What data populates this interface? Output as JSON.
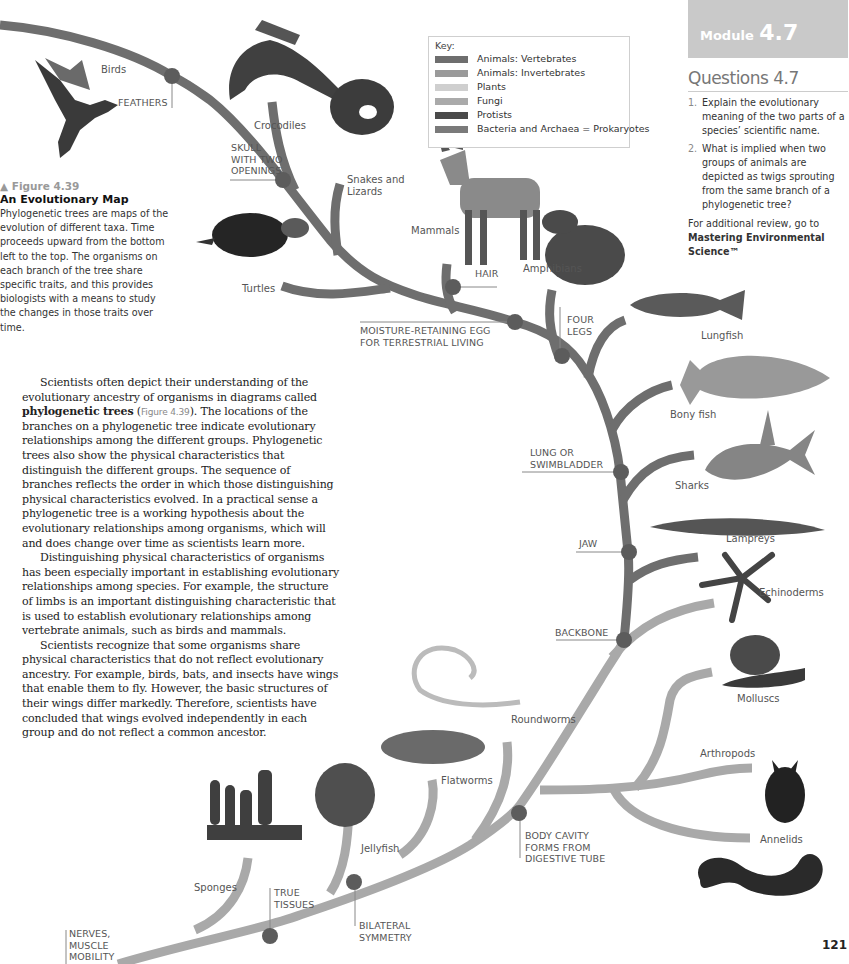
{
  "module": {
    "word": "Module",
    "number": "4.7"
  },
  "questions": {
    "title": "Questions 4.7",
    "items": [
      {
        "num": "1.",
        "text": "Explain the evolutionary meaning of the two parts of a species’ scientific name."
      },
      {
        "num": "2.",
        "text": "What is implied when two groups of animals are depicted as twigs sprouting from the same branch of a phylogenetic tree?"
      }
    ],
    "review_prefix": "For additional review, go to",
    "review_link": "Mastering Environmental Science™"
  },
  "key": {
    "title": "Key:",
    "items": [
      {
        "label": "Animals: Vertebrates",
        "color": "#6e6e6e"
      },
      {
        "label": "Animals: Invertebrates",
        "color": "#9a9a9a"
      },
      {
        "label": "Plants",
        "color": "#cfcfcf"
      },
      {
        "label": "Fungi",
        "color": "#aaaaaa"
      },
      {
        "label": "Protists",
        "color": "#4a4a4a"
      },
      {
        "label": "Bacteria and Archaea = Prokaryotes",
        "color": "#7a7a7a"
      }
    ]
  },
  "figure": {
    "number": "▲ Figure 4.39",
    "title": "An Evolutionary Map",
    "caption": "Phylogenetic trees are maps of the evolution of different taxa. Time proceeds upward from the bottom left to the top. The organisms on each branch of the tree share specific traits, and this provides biologists with a means to study the changes in those traits over time."
  },
  "body": {
    "p1_start": "Scientists often depict their understanding of the evolutionary ancestry of organisms in diagrams called ",
    "p1_term": "phylogenetic trees",
    "p1_open": " (",
    "p1_figref": "Figure 4.39",
    "p1_rest": "). The locations of the branches on a phylogenetic tree indicate evolutionary relationships among the different groups. Phylogenetic trees also show the physical characteristics that distinguish the different groups. The sequence of branches reflects the order in which those distinguishing physical characteristics evolved. In a practical sense a phylogenetic tree is a working hypothesis about the evolutionary relationships among organisms, which will and does change over time as scientists learn more.",
    "p2": "Distinguishing physical characteristics of organisms has been especially important in establishing evolutionary relationships among species. For example, the structure of limbs is an important distinguishing characteristic that is used to establish evolutionary relationships among vertebrate animals, such as birds and mammals.",
    "p3": "Scientists recognize that some organisms share physical characteristics that do not reflect evolutionary ancestry. For example, birds, bats, and insects have wings that enable them to fly. However, the basic structures of their wings differ markedly. Therefore, scientists have concluded that wings evolved independently in each group and do not reflect a common ancestor."
  },
  "taxa": {
    "birds": "Birds",
    "crocodiles": "Crocodiles",
    "snakes": "Snakes and\nLizards",
    "turtles": "Turtles",
    "mammals": "Mammals",
    "amphibians": "Amphibians",
    "lungfish": "Lungfish",
    "bony_fish": "Bony fish",
    "sharks": "Sharks",
    "lampreys": "Lampreys",
    "echinoderms": "Echinoderms",
    "molluscs": "Molluscs",
    "roundworms": "Roundworms",
    "arthropods": "Arthropods",
    "flatworms": "Flatworms",
    "annelids": "Annelids",
    "jellyfish": "Jellyfish",
    "sponges": "Sponges"
  },
  "traits": {
    "feathers": "FEATHERS",
    "skull": "SKULL\nWITH TWO\nOPENINGS",
    "hair": "HAIR",
    "egg": "MOISTURE-RETAINING EGG\nFOR TERRESTRIAL LIVING",
    "four_legs": "FOUR\nLEGS",
    "lung": "LUNG OR\nSWIMBLADDER",
    "jaw": "JAW",
    "backbone": "BACKBONE",
    "body_cavity": "BODY CAVITY\nFORMS FROM\nDIGESTIVE TUBE",
    "true_tissues": "TRUE\nTISSUES",
    "bilateral": "BILATERAL\nSYMMETRY",
    "nerves": "NERVES,\nMUSCLE\nMOBILITY"
  },
  "colors": {
    "vertebrate_branch": "#6e6e6e",
    "invertebrate_branch": "#a8a8a8",
    "node": "#5e5e5e"
  },
  "page_number": "121"
}
